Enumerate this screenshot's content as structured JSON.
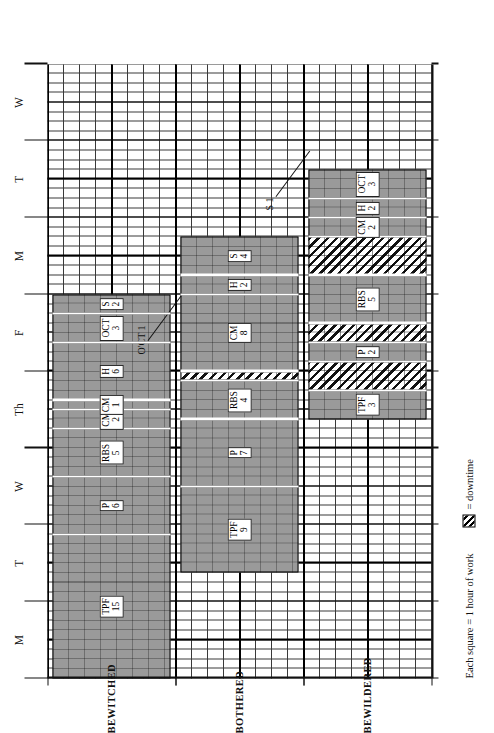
{
  "legend": {
    "square_note": "Each square = 1 hour of work",
    "downtime_icon": "hatch-swatch-icon",
    "downtime_label": "= downtime"
  },
  "axis": {
    "x_label": "",
    "y_label": "",
    "hours_per_day": 8,
    "day_ticks": [
      "M",
      "T",
      "W",
      "Th",
      "F",
      "M",
      "T",
      "W"
    ]
  },
  "rows": [
    {
      "name": "BEWITCHED"
    },
    {
      "name": "BOTHERED"
    },
    {
      "name": "BEWILDERED"
    }
  ],
  "annotations": [
    {
      "text": "O'CT 1",
      "target_row": 1,
      "target_hour": 40
    },
    {
      "text": "S 1",
      "target_row": 2,
      "target_hour": 55
    }
  ],
  "chart_data": {
    "type": "bar",
    "xlabel": "",
    "ylabel": "",
    "xlim": [
      0,
      64
    ],
    "grid": true,
    "legend_position": "bottom-left",
    "categories": [
      "BEWITCHED",
      "BOTHERED",
      "BEWILDERED"
    ],
    "unit": "1 square = 1 hour of work",
    "series": [
      {
        "name": "BEWITCHED",
        "row": 0,
        "tasks": [
          {
            "code": "TPF",
            "hours": 15,
            "start": 0,
            "kind": "work"
          },
          {
            "code": "P",
            "hours": 6,
            "start": 15,
            "kind": "work"
          },
          {
            "code": "RBS",
            "hours": 5,
            "start": 21,
            "kind": "work"
          },
          {
            "code": "CM",
            "hours": 2,
            "start": 26,
            "kind": "work"
          },
          {
            "code": "CM",
            "hours": 1,
            "start": 28,
            "kind": "work"
          },
          {
            "code": "H",
            "hours": 6,
            "start": 29,
            "kind": "work"
          },
          {
            "code": "OCT",
            "hours": 3,
            "start": 35,
            "kind": "work"
          },
          {
            "code": "S",
            "hours": 2,
            "start": 38,
            "kind": "work"
          }
        ],
        "total_hours": 40
      },
      {
        "name": "BOTHERED",
        "row": 1,
        "tasks": [
          {
            "code": "TPF",
            "hours": 9,
            "start": 11,
            "kind": "work"
          },
          {
            "code": "P",
            "hours": 7,
            "start": 20,
            "kind": "work"
          },
          {
            "code": "RBS",
            "hours": 4,
            "start": 27,
            "kind": "work"
          },
          {
            "code": "",
            "hours": 1,
            "start": 31,
            "kind": "downtime"
          },
          {
            "code": "CM",
            "hours": 8,
            "start": 32,
            "kind": "work"
          },
          {
            "code": "H",
            "hours": 2,
            "start": 40,
            "kind": "work"
          },
          {
            "code": "S",
            "hours": 4,
            "start": 42,
            "kind": "work"
          }
        ],
        "total_hours": 35
      },
      {
        "name": "BEWILDERED",
        "row": 2,
        "tasks": [
          {
            "code": "TPF",
            "hours": 3,
            "start": 27,
            "kind": "work"
          },
          {
            "code": "",
            "hours": 3,
            "start": 30,
            "kind": "downtime"
          },
          {
            "code": "P",
            "hours": 2,
            "start": 33,
            "kind": "work"
          },
          {
            "code": "",
            "hours": 2,
            "start": 35,
            "kind": "downtime"
          },
          {
            "code": "RBS",
            "hours": 5,
            "start": 37,
            "kind": "work"
          },
          {
            "code": "",
            "hours": 4,
            "start": 42,
            "kind": "downtime"
          },
          {
            "code": "CM",
            "hours": 2,
            "start": 46,
            "kind": "work"
          },
          {
            "code": "H",
            "hours": 2,
            "start": 48,
            "kind": "work"
          },
          {
            "code": "OCT",
            "hours": 3,
            "start": 50,
            "kind": "work"
          }
        ],
        "total_hours": 26
      }
    ]
  }
}
